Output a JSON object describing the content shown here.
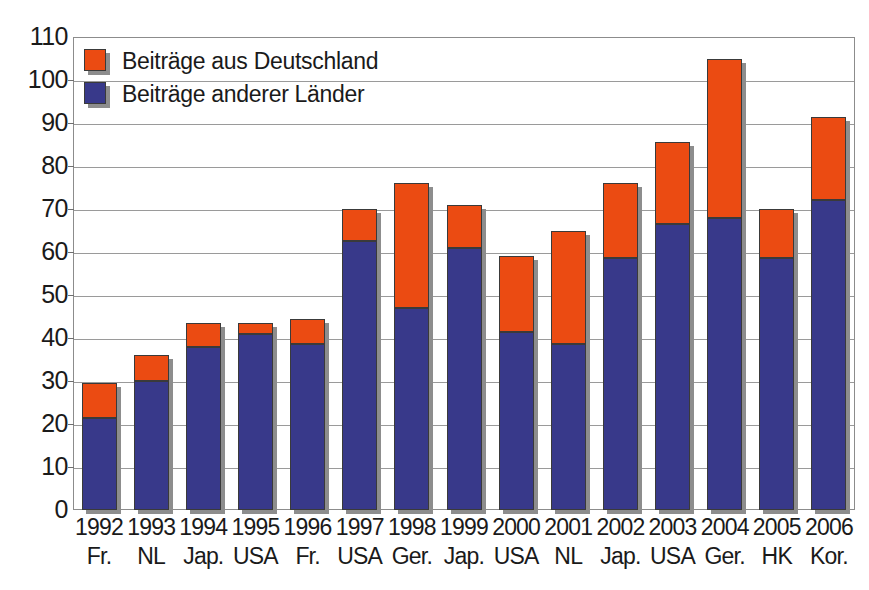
{
  "chart_data": {
    "type": "bar",
    "subtype": "stacked-bar",
    "title": "",
    "xlabel": "",
    "ylabel": "",
    "ylim": [
      0,
      110
    ],
    "ytick_step": 10,
    "ytick_labels": [
      "0",
      "10",
      "20",
      "30",
      "40",
      "50",
      "60",
      "70",
      "80",
      "90",
      "100",
      "110"
    ],
    "grid": true,
    "legend_position": "top-left",
    "categories": [
      "1992 Fr.",
      "1993 NL",
      "1994 Jap.",
      "1995 USA",
      "1996 Fr.",
      "1997 USA",
      "1998 Ger.",
      "1999 Jap.",
      "2000 USA",
      "2001 NL",
      "2002 Jap.",
      "2003 USA",
      "2004 Ger.",
      "2005 HK",
      "2006 Kor."
    ],
    "category_years": [
      "1992",
      "1993",
      "1994",
      "1995",
      "1996",
      "1997",
      "1998",
      "1999",
      "2000",
      "2001",
      "2002",
      "2003",
      "2004",
      "2005",
      "2006"
    ],
    "category_countries": [
      "Fr.",
      "NL",
      "Jap.",
      "USA",
      "Fr.",
      "USA",
      "Ger.",
      "Jap.",
      "USA",
      "NL",
      "Jap.",
      "USA",
      "Ger.",
      "HK",
      "Kor."
    ],
    "series": [
      {
        "name": "Beiträge anderer Länder",
        "color": "#38398a",
        "values": [
          21.5,
          30,
          38,
          41,
          38.5,
          62.5,
          47,
          61,
          41.5,
          38.5,
          58.5,
          66.5,
          68,
          58.5,
          72
        ]
      },
      {
        "name": "Beiträge aus Deutschland",
        "color": "#eb4b12",
        "values": [
          8,
          6,
          5.5,
          2.5,
          6,
          7.5,
          29,
          10,
          17.5,
          26.5,
          17.5,
          19,
          37,
          11.5,
          19.5
        ]
      }
    ],
    "totals": [
      29.5,
      36,
      43.5,
      43.5,
      44.5,
      70,
      76,
      71,
      59,
      65,
      76,
      85.5,
      105,
      70,
      91.5
    ]
  },
  "legend": {
    "entries": [
      {
        "label": "Beiträge aus Deutschland",
        "color": "#eb4b12"
      },
      {
        "label": "Beiträge anderer Länder",
        "color": "#38398a"
      }
    ]
  },
  "colors": {
    "orange": "#eb4b12",
    "blue": "#38398a",
    "grid": "#9a9a9a",
    "frame": "#8c8c8c",
    "shadow": "#8d8d8d",
    "text": "#1a1a1a",
    "background": "#ffffff"
  }
}
